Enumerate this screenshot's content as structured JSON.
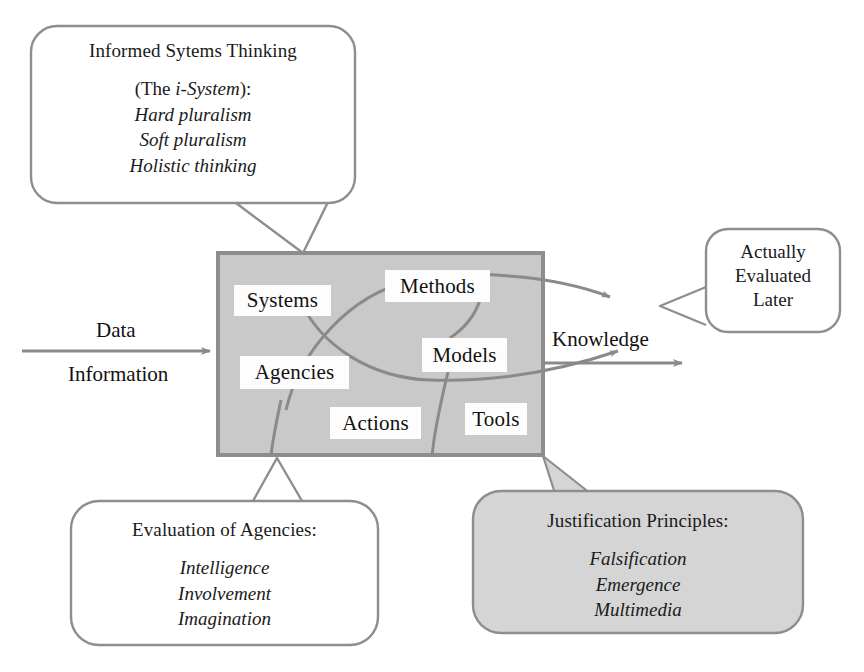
{
  "figure": {
    "colors": {
      "process_box_fill": "#c9c9c9",
      "process_box_border": "#8c8c8c",
      "callout_border": "#8e8e8e",
      "callout_fill_white": "#ffffff",
      "callout_fill_grey": "#d5d5d5",
      "arrow": "#8a8a8a",
      "text": "#1a1a1a",
      "chip_fill": "#fdfdfd"
    }
  },
  "callouts": {
    "informed_systems_thinking": {
      "name": "informed-systems-thinking",
      "title": "Informed Sytems Thinking",
      "subtitle_prefix": "(The ",
      "subtitle_italic": "i-System",
      "subtitle_suffix": "):",
      "items": [
        "Hard pluralism",
        "Soft pluralism",
        "Holistic thinking"
      ]
    },
    "actually_evaluated_later": {
      "name": "actually-evaluated-later",
      "lines": [
        "Actually",
        "Evaluated",
        "Later"
      ]
    },
    "evaluation_of_agencies": {
      "name": "evaluation-of-agencies",
      "title": "Evaluation of Agencies:",
      "items": [
        "Intelligence",
        "Involvement",
        "Imagination"
      ]
    },
    "justification_principles": {
      "name": "justification-principles",
      "title": "Justification Principles:",
      "items": [
        "Falsification",
        "Emergence",
        "Multimedia"
      ]
    }
  },
  "process_box": {
    "name": "i-system-process-box",
    "chips": [
      {
        "id": "systems",
        "label": "Systems"
      },
      {
        "id": "methods",
        "label": "Methods"
      },
      {
        "id": "agencies",
        "label": "Agencies"
      },
      {
        "id": "models",
        "label": "Models"
      },
      {
        "id": "actions",
        "label": "Actions"
      },
      {
        "id": "tools",
        "label": "Tools"
      }
    ]
  },
  "flow": {
    "input_top": "Data",
    "input_bottom": "Information",
    "output": "Knowledge"
  }
}
